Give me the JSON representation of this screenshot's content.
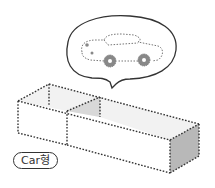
{
  "label": {
    "text": "Car형"
  },
  "illustration": {
    "description": "Open rectangular box divided into compartments with dotted edges, and a thought bubble containing a dotted-outline car",
    "colors": {
      "line": "#333333",
      "dots": "#555555",
      "shade_light": "#ececec",
      "shade_dark": "#b8b8b8",
      "wheel": "#777777"
    }
  }
}
